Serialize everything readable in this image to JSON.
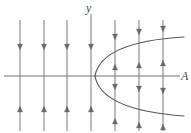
{
  "figure": {
    "background_color": "#ffffff",
    "width": 191,
    "height": 133,
    "stroke_color": "#6b6b6b",
    "curve_color": "#5a5a5a",
    "axis_color": "#757575"
  },
  "axes": {
    "x_axis": {
      "name": "x-axis",
      "label": "A",
      "y_position": 76,
      "x_start": 4,
      "x_end": 180
    },
    "y_axis": {
      "name": "y-axis",
      "label": "y",
      "x_position": 91,
      "y_start": 14,
      "y_end": 128
    }
  },
  "curve": {
    "name": "parabola",
    "type": "sideways-parabola",
    "description": "opens to the right, vertex at origin",
    "vertex": {
      "x": 95,
      "y": 76
    },
    "upper_endpoint": {
      "x": 184,
      "y": 37
    },
    "lower_endpoint": {
      "x": 184,
      "y": 116
    }
  },
  "field_lines": [
    {
      "x": 20,
      "top": 20,
      "bottom": 131
    },
    {
      "x": 44,
      "top": 20,
      "bottom": 131
    },
    {
      "x": 67,
      "top": 20,
      "bottom": 131
    },
    {
      "x": 91,
      "top": 14,
      "bottom": 131
    },
    {
      "x": 115,
      "top": 20,
      "bottom": 131
    },
    {
      "x": 139,
      "top": 20,
      "bottom": 131
    },
    {
      "x": 163,
      "top": 20,
      "bottom": 131
    }
  ],
  "arrows": [
    {
      "name": "arrow-down-upper-1",
      "x": 20,
      "y": 50,
      "direction": "down"
    },
    {
      "name": "arrow-down-upper-2",
      "x": 44,
      "y": 50,
      "direction": "down"
    },
    {
      "name": "arrow-down-upper-3",
      "x": 67,
      "y": 50,
      "direction": "down"
    },
    {
      "name": "arrow-down-upper-4",
      "x": 91,
      "y": 50,
      "direction": "down"
    },
    {
      "name": "arrow-down-upper-5",
      "x": 115,
      "y": 40,
      "direction": "down"
    },
    {
      "name": "arrow-down-upper-6",
      "x": 139,
      "y": 35,
      "direction": "down"
    },
    {
      "name": "arrow-down-upper-7",
      "x": 163,
      "y": 32,
      "direction": "down"
    },
    {
      "name": "arrow-up-inner-1",
      "x": 115,
      "y": 64,
      "direction": "up"
    },
    {
      "name": "arrow-up-inner-2",
      "x": 139,
      "y": 62,
      "direction": "up"
    },
    {
      "name": "arrow-up-inner-3",
      "x": 163,
      "y": 60,
      "direction": "up"
    },
    {
      "name": "arrow-down-inner-1",
      "x": 115,
      "y": 90,
      "direction": "down"
    },
    {
      "name": "arrow-down-inner-2",
      "x": 139,
      "y": 92,
      "direction": "down"
    },
    {
      "name": "arrow-down-inner-3",
      "x": 163,
      "y": 94,
      "direction": "down"
    },
    {
      "name": "arrow-up-lower-1",
      "x": 20,
      "y": 106,
      "direction": "up"
    },
    {
      "name": "arrow-up-lower-2",
      "x": 44,
      "y": 106,
      "direction": "up"
    },
    {
      "name": "arrow-up-lower-3",
      "x": 67,
      "y": 106,
      "direction": "up"
    },
    {
      "name": "arrow-up-lower-4",
      "x": 91,
      "y": 106,
      "direction": "up"
    },
    {
      "name": "arrow-up-lower-5",
      "x": 115,
      "y": 118,
      "direction": "up"
    },
    {
      "name": "arrow-up-lower-6",
      "x": 139,
      "y": 122,
      "direction": "up"
    },
    {
      "name": "arrow-up-lower-7",
      "x": 163,
      "y": 124,
      "direction": "up"
    }
  ],
  "chart_data": {
    "type": "line",
    "title": "",
    "xlabel": "A",
    "ylabel": "y",
    "grid": false,
    "legend": null,
    "series": [
      {
        "name": "parabola-upper-branch",
        "x": [
          95,
          100,
          110,
          125,
          145,
          165,
          184
        ],
        "y": [
          76,
          66,
          57,
          49,
          43,
          39,
          37
        ]
      },
      {
        "name": "parabola-lower-branch",
        "x": [
          95,
          100,
          110,
          125,
          145,
          165,
          184
        ],
        "y": [
          76,
          86,
          95,
          103,
          109,
          113,
          116
        ]
      }
    ],
    "annotations": [
      "Downward arrows above the parabola and to the left of the vertex",
      "Upward arrows inside the parabola above the x-axis",
      "Downward arrows inside the parabola below the x-axis",
      "Upward arrows below the parabola and to the left of the vertex"
    ]
  }
}
